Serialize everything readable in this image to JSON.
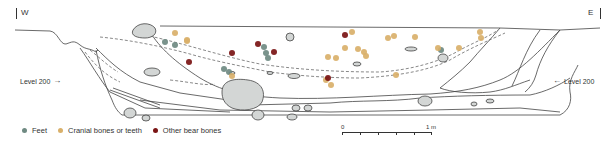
{
  "figure": {
    "orientation": {
      "west": "W",
      "east": "E"
    },
    "level_marker": {
      "left_label": "Level 200",
      "right_label": "Level 200",
      "left_arrow": "→",
      "right_arrow": "←"
    },
    "scale_bar": {
      "start_label": "0",
      "end_label": "1 m",
      "subdivisions": 5
    },
    "legend": [
      {
        "key": "feet",
        "label": "Feet",
        "color": "#6f8a82"
      },
      {
        "key": "cranial",
        "label": "Cranial bones or teeth",
        "color": "#d9b06a"
      },
      {
        "key": "other",
        "label": "Other bear bones",
        "color": "#7a1414"
      }
    ],
    "colors": {
      "line": "#444444",
      "stone_fill": "#d3d6d5",
      "feet": "#6f8a82",
      "cranial": "#d9b06a",
      "other": "#7a1414"
    },
    "points": [
      {
        "type": "feet",
        "x": 165,
        "y": 42
      },
      {
        "type": "feet",
        "x": 175,
        "y": 45
      },
      {
        "type": "feet",
        "x": 224,
        "y": 69
      },
      {
        "type": "feet",
        "x": 229,
        "y": 72
      },
      {
        "type": "feet",
        "x": 264,
        "y": 47
      },
      {
        "type": "feet",
        "x": 266,
        "y": 53
      },
      {
        "type": "feet",
        "x": 268,
        "y": 58
      },
      {
        "type": "feet",
        "x": 441,
        "y": 50
      },
      {
        "type": "cranial",
        "x": 175,
        "y": 33
      },
      {
        "type": "cranial",
        "x": 187,
        "y": 40
      },
      {
        "type": "cranial",
        "x": 232,
        "y": 76
      },
      {
        "type": "cranial",
        "x": 187,
        "y": 41
      },
      {
        "type": "cranial",
        "x": 352,
        "y": 32
      },
      {
        "type": "cranial",
        "x": 388,
        "y": 38
      },
      {
        "type": "cranial",
        "x": 394,
        "y": 36
      },
      {
        "type": "cranial",
        "x": 345,
        "y": 48
      },
      {
        "type": "cranial",
        "x": 358,
        "y": 49
      },
      {
        "type": "cranial",
        "x": 364,
        "y": 52
      },
      {
        "type": "cranial",
        "x": 366,
        "y": 56
      },
      {
        "type": "cranial",
        "x": 328,
        "y": 57
      },
      {
        "type": "cranial",
        "x": 336,
        "y": 58
      },
      {
        "type": "cranial",
        "x": 396,
        "y": 75
      },
      {
        "type": "cranial",
        "x": 326,
        "y": 80
      },
      {
        "type": "cranial",
        "x": 331,
        "y": 85
      },
      {
        "type": "cranial",
        "x": 415,
        "y": 37
      },
      {
        "type": "cranial",
        "x": 438,
        "y": 48
      },
      {
        "type": "cranial",
        "x": 459,
        "y": 48
      },
      {
        "type": "cranial",
        "x": 480,
        "y": 32
      },
      {
        "type": "cranial",
        "x": 481,
        "y": 38
      },
      {
        "type": "other",
        "x": 189,
        "y": 62
      },
      {
        "type": "other",
        "x": 232,
        "y": 53
      },
      {
        "type": "other",
        "x": 258,
        "y": 44
      },
      {
        "type": "other",
        "x": 274,
        "y": 52
      },
      {
        "type": "other",
        "x": 328,
        "y": 78
      },
      {
        "type": "other",
        "x": 345,
        "y": 35
      }
    ]
  }
}
